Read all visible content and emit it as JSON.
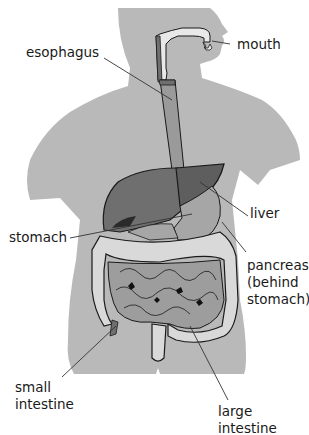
{
  "diagram": {
    "colors": {
      "background": "#ffffff",
      "body_silhouette": "#b9b9b9",
      "liver": "#6f6f6f",
      "liver_right_lobe": "#5e5e5e",
      "stomach": "#a6a6a6",
      "esophagus": "#9a9a9a",
      "mouth_tract": "#e8e8e8",
      "large_intestine": "#d9d9d9",
      "small_intestine": "#9d9d9d",
      "outline": "#1a1a1a",
      "leader_line": "#333333",
      "label_text": "#1a1a1a"
    },
    "labels": {
      "mouth": "mouth",
      "esophagus": "esophagus",
      "liver": "liver",
      "stomach": "stomach",
      "pancreas_line1": "pancreas",
      "pancreas_line2": "(behind",
      "pancreas_line3": "stomach)",
      "small_intestine_line1": "small",
      "small_intestine_line2": "intestine",
      "large_intestine_line1": "large",
      "large_intestine_line2": "intestine"
    }
  }
}
